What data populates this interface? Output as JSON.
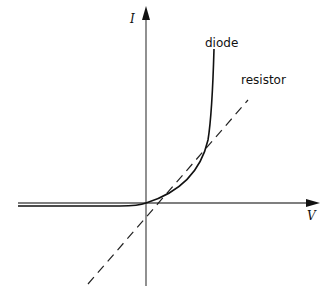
{
  "figure": {
    "axes": {
      "y_label": "I",
      "x_label": "V"
    },
    "curves": [
      {
        "name": "diode",
        "label": "diode",
        "style": "solid"
      },
      {
        "name": "resistor",
        "label": "resistor",
        "style": "dashed"
      }
    ]
  },
  "colors": {
    "ink": "#111111",
    "axis": "#555555",
    "background": "#ffffff"
  }
}
